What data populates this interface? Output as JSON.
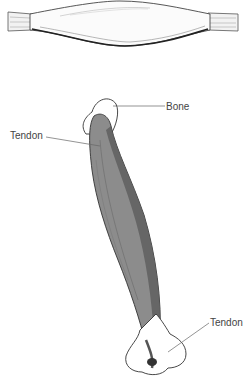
{
  "diagram": {
    "type": "anatomical illustration",
    "panels": [
      {
        "id": "relaxed-muscle-side-view",
        "description": "Horizontal spindle-shaped muscle with tendons at both ends"
      },
      {
        "id": "muscle-with-attachments",
        "description": "Diagonal fusiform muscle attached to bone via tendons"
      }
    ],
    "labels": {
      "bone": "Bone",
      "tendon_top": "Tendon",
      "tendon_bottom": "Tendon"
    },
    "colors": {
      "muscle_fill": "#8c8c8c",
      "muscle_dark": "#5a5a5a",
      "outline": "#333333",
      "leader_line": "#666666",
      "label_text": "#444444",
      "background": "#ffffff"
    }
  }
}
